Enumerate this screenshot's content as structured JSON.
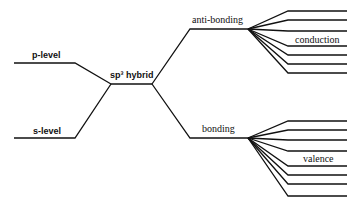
{
  "diagram": {
    "type": "energy-level diagram",
    "labels": {
      "p_level": "p-level",
      "s_level": "s-level",
      "hybrid": "sp³ hybrid",
      "anti_bonding": "anti-bonding",
      "bonding": "bonding",
      "conduction": "conduction",
      "valence": "valence"
    },
    "line_color": "#111111",
    "conduction_levels": 7,
    "valence_levels": 8
  }
}
